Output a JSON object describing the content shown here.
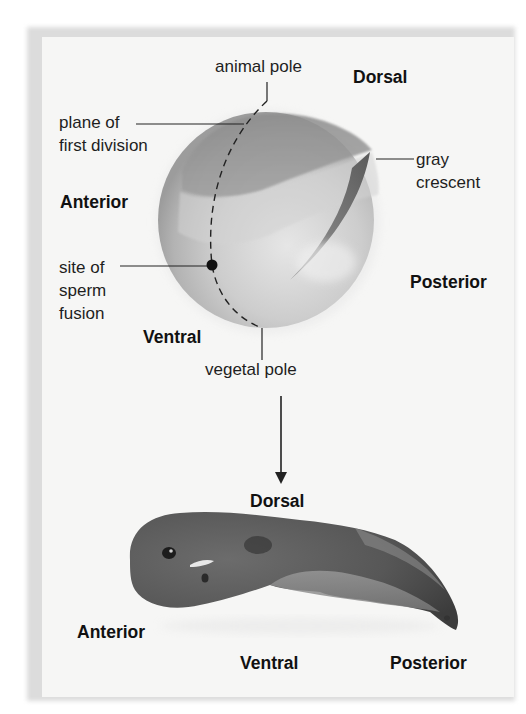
{
  "figure": {
    "egg": {
      "labels": {
        "animal_pole": "animal pole",
        "dorsal": "Dorsal",
        "plane_of_first_division": "plane of\nfirst division",
        "anterior": "Anterior",
        "gray_crescent": "gray\ncrescent",
        "site_of_sperm_fusion": "site of\nsperm\nfusion",
        "posterior": "Posterior",
        "ventral": "Ventral",
        "vegetal_pole": "vegetal pole"
      }
    },
    "arrow": {
      "direction": "down",
      "meaning": "develops into"
    },
    "tadpole": {
      "labels": {
        "dorsal": "Dorsal",
        "anterior": "Anterior",
        "ventral": "Ventral",
        "posterior": "Posterior"
      }
    },
    "colors": {
      "background": "#f6f6f5",
      "border": "#dcdcdc",
      "text": "#1e1e1e",
      "egg_light": "#c9c9c9",
      "egg_dark": "#8a8a8a",
      "gray_crescent": "#6e6e6e",
      "tadpole_dark": "#4a4a4a",
      "tadpole_light": "#9a9a9a"
    }
  }
}
